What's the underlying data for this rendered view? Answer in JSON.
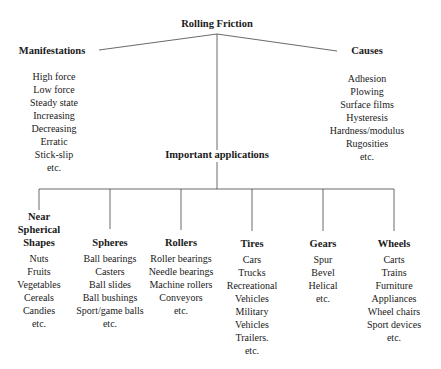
{
  "title": "Rolling Friction",
  "manifestations": {
    "label": "Manifestations",
    "items": [
      "High force",
      "Low force",
      "Steady state",
      "Increasing",
      "Decreasing",
      "Erratic",
      "Stick-slip",
      "etc."
    ]
  },
  "causes": {
    "label": "Causes",
    "items": [
      "Adhesion",
      "Plowing",
      "Surface films",
      "Hysteresis",
      "Hardness/modulus",
      "Rugosities",
      "etc."
    ]
  },
  "applications": {
    "label": "Important applications",
    "categories": [
      {
        "label_lines": [
          "Near",
          "Spherical",
          "Shapes"
        ],
        "items": [
          "Nuts",
          "Fruits",
          "Vegetables",
          "Cereals",
          "Candies",
          "etc."
        ]
      },
      {
        "label_lines": [
          "Spheres"
        ],
        "items": [
          "Ball bearings",
          "Casters",
          "Ball slides",
          "Ball bushings",
          "Sport/game balls",
          "etc."
        ]
      },
      {
        "label_lines": [
          "Rollers"
        ],
        "items": [
          "Roller bearings",
          "Needle bearings",
          "Machine rollers",
          "Conveyors",
          "etc."
        ]
      },
      {
        "label_lines": [
          "Tires"
        ],
        "items": [
          "Cars",
          "Trucks",
          "Recreational",
          "Vehicles",
          "Military",
          "Vehicles",
          "Trailers.",
          "etc."
        ]
      },
      {
        "label_lines": [
          "Gears"
        ],
        "items": [
          "Spur",
          "Bevel",
          "Helical",
          "etc."
        ]
      },
      {
        "label_lines": [
          "Wheels"
        ],
        "items": [
          "Carts",
          "Trains",
          "Furniture",
          "Appliances",
          "Wheel chairs",
          "Sport devices",
          "etc."
        ]
      }
    ]
  }
}
